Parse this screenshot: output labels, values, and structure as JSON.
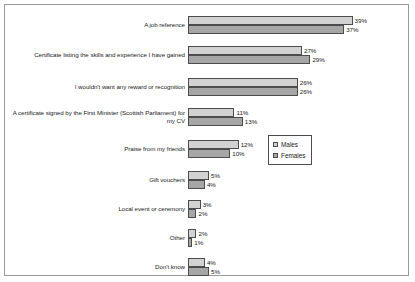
{
  "chart_data": {
    "type": "bar",
    "orientation": "horizontal",
    "title": "",
    "subtitle": "",
    "xlabel": "",
    "ylabel": "",
    "grid": false,
    "xlim": [
      0,
      42
    ],
    "legend_position": "middle-right",
    "categories": [
      "A job reference",
      "Certificate listing the skills and experience I have gained",
      "I wouldn't want any reward or recognition",
      "A certificate signed by the First Minister (Scottish Parliament) for my CV",
      "Praise from my friends",
      "Gift vouchers",
      "Local event or ceremony",
      "Other",
      "Don't know"
    ],
    "series": [
      {
        "name": "Males",
        "color": "#d2d2d2",
        "values": [
          39,
          27,
          26,
          11,
          12,
          5,
          3,
          2,
          4
        ],
        "labels": [
          "39%",
          "27%",
          "26%",
          "11%",
          "12%",
          "5%",
          "3%",
          "2%",
          "4%"
        ]
      },
      {
        "name": "Females",
        "color": "#a6a6a6",
        "values": [
          37,
          29,
          26,
          13,
          10,
          4,
          2,
          1,
          5
        ],
        "labels": [
          "37%",
          "29%",
          "26%",
          "13%",
          "10%",
          "4%",
          "2%",
          "1%",
          "5%"
        ]
      }
    ]
  },
  "legend": {
    "items": [
      {
        "label": "Males",
        "color": "#d2d2d2"
      },
      {
        "label": "Females",
        "color": "#a6a6a6"
      }
    ]
  }
}
